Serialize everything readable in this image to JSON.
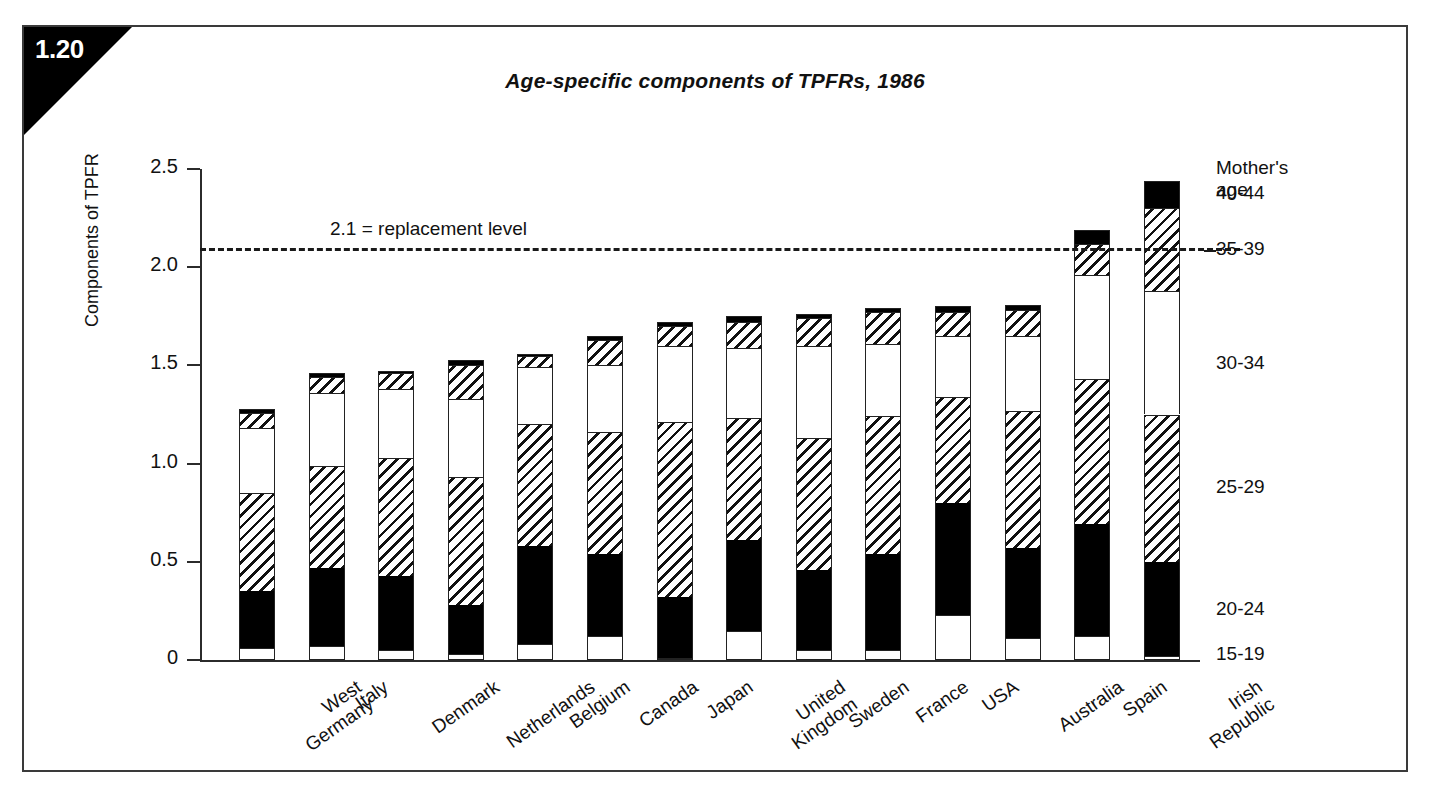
{
  "figure": {
    "number": "1.20",
    "title": "Age-specific components of TPFRs, 1986"
  },
  "axes": {
    "ytitle": "Components of TPFR",
    "yticks": [
      "0",
      "0.5",
      "1.0",
      "1.5",
      "2.0",
      "2.5"
    ],
    "ytick_values": [
      0,
      0.5,
      1.0,
      1.5,
      2.0,
      2.5
    ],
    "ylim": [
      0,
      2.5
    ]
  },
  "annotation": {
    "replacement_label": "2.1 = replacement level",
    "replacement_value": 2.1
  },
  "legend": {
    "title_line1": "Mother's",
    "title_line2": "age",
    "items": [
      {
        "label": "40-44",
        "fill": "black"
      },
      {
        "label": "35-39",
        "fill": "hatch"
      },
      {
        "label": "30-34",
        "fill": "white"
      },
      {
        "label": "25-29",
        "fill": "hatch"
      },
      {
        "label": "20-24",
        "fill": "black"
      },
      {
        "label": "15-19",
        "fill": "white"
      }
    ]
  },
  "chart_data": {
    "type": "bar",
    "subtype": "stacked-vertical",
    "title": "Age-specific components of TPFRs, 1986",
    "xlabel": "",
    "ylabel": "Components of TPFR",
    "ylim": [
      0,
      2.5
    ],
    "yticks": [
      0,
      0.5,
      1.0,
      1.5,
      2.0,
      2.5
    ],
    "grid": false,
    "legend_position": "right",
    "legend_title": "Mother's age",
    "categories": [
      "West Germany",
      "Italy",
      "Denmark",
      "Netherlands",
      "Belgium",
      "Canada",
      "Japan",
      "United Kingdom",
      "Sweden",
      "France",
      "USA",
      "Australia",
      "Spain",
      "Irish Republic"
    ],
    "series": [
      {
        "name": "15-19",
        "fill": "white",
        "values": [
          0.06,
          0.07,
          0.05,
          0.03,
          0.08,
          0.12,
          0.01,
          0.15,
          0.05,
          0.05,
          0.23,
          0.11,
          0.12,
          0.02
        ]
      },
      {
        "name": "20-24",
        "fill": "black",
        "values": [
          0.29,
          0.4,
          0.38,
          0.25,
          0.5,
          0.42,
          0.31,
          0.46,
          0.41,
          0.49,
          0.57,
          0.46,
          0.57,
          0.48
        ]
      },
      {
        "name": "25-29",
        "fill": "hatch",
        "values": [
          0.5,
          0.52,
          0.6,
          0.65,
          0.62,
          0.62,
          0.89,
          0.62,
          0.67,
          0.7,
          0.54,
          0.7,
          0.74,
          0.75
        ]
      },
      {
        "name": "30-34",
        "fill": "white",
        "values": [
          0.33,
          0.37,
          0.35,
          0.4,
          0.29,
          0.34,
          0.39,
          0.36,
          0.47,
          0.37,
          0.31,
          0.38,
          0.53,
          0.63
        ]
      },
      {
        "name": "35-39",
        "fill": "hatch",
        "values": [
          0.08,
          0.08,
          0.08,
          0.17,
          0.06,
          0.13,
          0.1,
          0.13,
          0.14,
          0.16,
          0.12,
          0.13,
          0.16,
          0.42
        ]
      },
      {
        "name": "40-44",
        "fill": "black",
        "values": [
          0.02,
          0.02,
          0.01,
          0.03,
          0.01,
          0.02,
          0.02,
          0.03,
          0.02,
          0.02,
          0.03,
          0.03,
          0.07,
          0.14
        ]
      }
    ],
    "totals": [
      1.28,
      1.45,
      1.47,
      1.53,
      1.56,
      1.65,
      1.72,
      1.75,
      1.76,
      1.79,
      1.8,
      1.81,
      2.19,
      2.44
    ],
    "reference_line": {
      "value": 2.1,
      "label": "2.1 = replacement level",
      "style": "dashed"
    }
  }
}
